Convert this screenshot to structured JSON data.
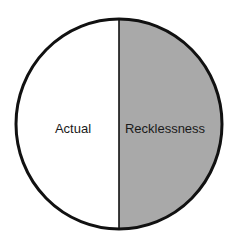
{
  "diagram": {
    "type": "split-circle",
    "left_half": {
      "label": "Actual",
      "fill": "#ffffff"
    },
    "right_half": {
      "label": "Recklessness",
      "fill": "#a9a9a9"
    },
    "outline_color": "#111111"
  }
}
